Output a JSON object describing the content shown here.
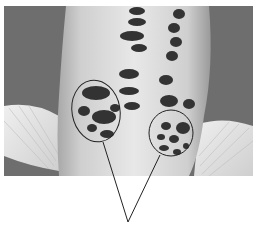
{
  "figure": {
    "colors": {
      "background": "#6a6a6a",
      "body": "#d9d9d9",
      "spots": "#3a3a3a",
      "fins": "#e4e4e4",
      "annotation_line": "#222222"
    },
    "annotations": [
      {
        "shape": "ellipse",
        "cx": 96,
        "cy": 111,
        "rx": 24,
        "ry": 31,
        "rotate": -10
      },
      {
        "shape": "ellipse",
        "cx": 171,
        "cy": 133,
        "rx": 22,
        "ry": 23,
        "rotate": 0
      }
    ],
    "pointer_apex": {
      "x": 128,
      "y": 222
    },
    "caption": ""
  }
}
